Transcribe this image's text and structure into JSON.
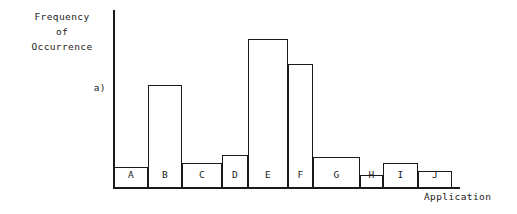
{
  "chart_data": {
    "type": "bar",
    "title": "",
    "panel_label": "a)",
    "ylabel": "Frequency\nof\nOccurrence",
    "ylabel_lines": [
      "Frequency",
      "of",
      "Occurrence"
    ],
    "xlabel": "Application",
    "grid": false,
    "legend": false,
    "axis_ticks": false,
    "categories": [
      "A",
      "B",
      "C",
      "D",
      "E",
      "F",
      "G",
      "H",
      "I",
      "J"
    ],
    "values": [
      14,
      69,
      17,
      22,
      83,
      69,
      21,
      8,
      17,
      11
    ],
    "ylim": [
      0,
      100
    ],
    "note": "Values estimated from bar pixel heights relative to baseline; axis is unlabeled."
  },
  "bars": [
    {
      "label": "A",
      "x": 114,
      "width": 34,
      "top": 167,
      "value": 14
    },
    {
      "label": "B",
      "x": 148,
      "width": 34,
      "top": 85,
      "value": 69
    },
    {
      "label": "C",
      "x": 182,
      "width": 40,
      "top": 163,
      "value": 17
    },
    {
      "label": "D",
      "x": 222,
      "width": 26,
      "top": 155,
      "value": 22
    },
    {
      "label": "E",
      "x": 248,
      "width": 40,
      "top": 39,
      "value": 83
    },
    {
      "label": "F",
      "x": 288,
      "width": 25,
      "top": 64,
      "value": 69
    },
    {
      "label": "G",
      "x": 313,
      "width": 47,
      "top": 157,
      "value": 21
    },
    {
      "label": "H",
      "x": 360,
      "width": 23,
      "top": 175,
      "value": 8
    },
    {
      "label": "I",
      "x": 383,
      "width": 35,
      "top": 163,
      "value": 17
    },
    {
      "label": "J",
      "x": 418,
      "width": 34,
      "top": 171,
      "value": 11
    }
  ],
  "colors": {
    "ink": "#1a1a1a",
    "background": "#ffffff"
  }
}
